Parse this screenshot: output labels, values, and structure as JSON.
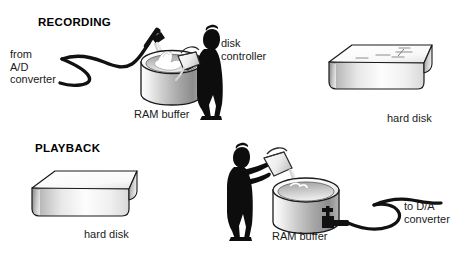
{
  "figure": {
    "background_color": "#ffffff",
    "ink_color": "#000000"
  },
  "sections": {
    "recording": {
      "heading": "RECORDING",
      "labels": {
        "source": "from\nA/D\nconverter",
        "buffer": "RAM buffer",
        "controller": "disk\ncontroller",
        "disk": "hard disk"
      },
      "icons": {
        "hose": "hose-icon",
        "nozzle": "nozzle-icon",
        "tank": "cylinder-tank-icon",
        "person": "person-silhouette-icon",
        "bucket": "bucket-icon",
        "box": "hard-disk-box-icon"
      }
    },
    "playback": {
      "heading": "PLAYBACK",
      "labels": {
        "disk": "hard disk",
        "buffer": "RAM buffer",
        "destination": "to D/A\nconverter"
      },
      "icons": {
        "box": "hard-disk-box-icon",
        "person": "person-silhouette-icon",
        "bucket": "bucket-icon",
        "tank": "cylinder-tank-icon",
        "spigot": "spigot-valve-icon",
        "hose": "hose-icon"
      }
    }
  },
  "colors": {
    "tank_light": "#f2f2f2",
    "tank_mid": "#c9c9c9",
    "tank_dark": "#8a8a8a",
    "box_top": "#fbfbfb",
    "box_front_light": "#ffffff",
    "box_front_dark": "#9a9a9a",
    "silhouette": "#0d0d0d",
    "outline": "#1a1a1a"
  }
}
